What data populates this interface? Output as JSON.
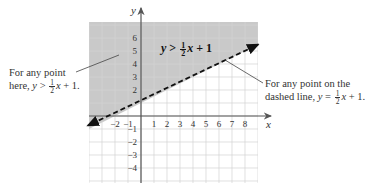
{
  "figure": {
    "inequality_label": {
      "lhs": "y",
      "op": ">",
      "num": "1",
      "den": "2",
      "var": "x",
      "rest": "+ 1"
    },
    "left_note": {
      "line1": "For any point",
      "line2_prefix": "here, ",
      "var_y": "y",
      "op": ">",
      "num": "1",
      "den": "2",
      "var_x": "x",
      "rest": "+ 1."
    },
    "right_note": {
      "line1": "For any point on the",
      "line2_prefix": "dashed line, ",
      "var_y": "y",
      "op": "=",
      "num": "1",
      "den": "2",
      "var_x": "x",
      "rest": "+ 1."
    },
    "axis_labels": {
      "x": "x",
      "y": "y"
    },
    "x_ticks": [
      "-2",
      "-1",
      "1",
      "2",
      "3",
      "4",
      "5",
      "6",
      "7",
      "8"
    ],
    "y_ticks": [
      "6",
      "5",
      "4",
      "3",
      "2",
      "-1",
      "-2",
      "-3",
      "-4"
    ],
    "colors": {
      "shade": "#c9c9c9",
      "grid": "#d8d8d8",
      "grid_shaded": "#b4b4b4",
      "axis": "#555555",
      "line": "#111111"
    }
  },
  "chart_data": {
    "type": "line",
    "xlabel": "x",
    "ylabel": "y",
    "xlim": [
      -4,
      9
    ],
    "ylim": [
      -5,
      7
    ],
    "grid": true,
    "boundary": {
      "equation": "y = 1/2 x + 1",
      "style": "dashed",
      "slope": 0.5,
      "intercept": 1
    },
    "shaded_region": "above boundary line",
    "x_tick_labels": [
      -2,
      -1,
      1,
      2,
      3,
      4,
      5,
      6,
      7,
      8
    ],
    "y_tick_labels": [
      6,
      5,
      4,
      3,
      2,
      -1,
      -2,
      -3,
      -4
    ],
    "annotations": [
      "y > 1/2 x + 1",
      "For any point here, y > 1/2 x + 1.",
      "For any point on the dashed line, y = 1/2 x + 1."
    ]
  }
}
